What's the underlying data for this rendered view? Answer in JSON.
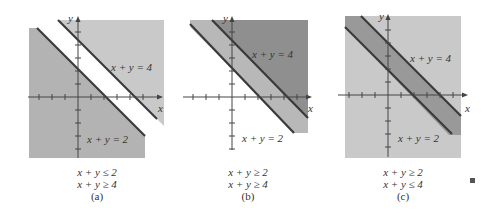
{
  "colors": {
    "light_gray": "#c9c9c9",
    "medium_gray": "#b3b3b3",
    "dark_gray": "#8f8f8f",
    "line": "#3a3a3a",
    "axis": "#444444",
    "text": "#333333"
  },
  "panels": [
    {
      "id": "a",
      "caption": "(a)",
      "inequalities": [
        "x + y ≤ 2",
        "x + y ≥ 4"
      ],
      "line_labels": [
        "x + y = 4",
        "x + y = 2"
      ],
      "axis_labels": {
        "x": "x",
        "y": "y"
      },
      "shading": "regions x+y≤2 and x+y≥4 shaded; strip between lines unshaded"
    },
    {
      "id": "b",
      "caption": "(b)",
      "inequalities": [
        "x + y ≥ 2",
        "x + y ≥ 4"
      ],
      "line_labels": [
        "x + y = 4",
        "x + y = 2"
      ],
      "axis_labels": {
        "x": "x",
        "y": "y"
      },
      "shading": "x+y≥2 light; x+y≥4 dark (overlap)"
    },
    {
      "id": "c",
      "caption": "(c)",
      "inequalities": [
        "x + y ≥ 2",
        "x + y ≤ 4"
      ],
      "line_labels": [
        "x + y = 4",
        "x + y = 2"
      ],
      "axis_labels": {
        "x": "x",
        "y": "y"
      },
      "shading": "whole area light; strip 2≤x+y≤4 dark (overlap)"
    }
  ],
  "end_mark": "■"
}
